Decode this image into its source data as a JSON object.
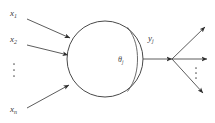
{
  "figure": {
    "type": "neuron-schematic-diagram",
    "background_color": "#ffffff",
    "stroke_color": "#4a4a4a",
    "arrow_color": "#2e2e2e"
  },
  "inputs": {
    "labels": [
      {
        "base": "x",
        "sub": "1",
        "x": 10,
        "y": 16
      },
      {
        "base": "x",
        "sub": "2",
        "x": 10,
        "y": 42
      },
      {
        "base": "x",
        "sub": "n",
        "x": 10,
        "y": 112
      }
    ],
    "ellipsis_dots": 3
  },
  "node": {
    "center_x": 105,
    "center_y": 59,
    "radius": 38,
    "theta": {
      "base": "θ",
      "sub": "j",
      "x": 118,
      "y": 62
    }
  },
  "output": {
    "label": {
      "base": "y",
      "sub": "j",
      "x": 148,
      "y": 41
    },
    "branch_count": 3,
    "ellipsis_dots": 3
  }
}
